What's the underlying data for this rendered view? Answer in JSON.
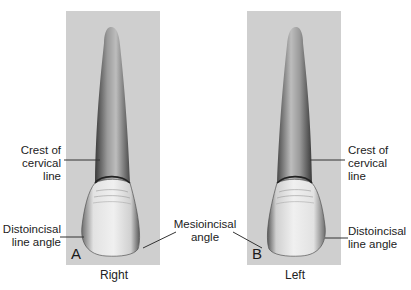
{
  "figure": {
    "panels": [
      {
        "letter": "A",
        "caption": "Right"
      },
      {
        "letter": "B",
        "caption": "Left"
      }
    ],
    "labels": {
      "crest_left": [
        "Crest of",
        "cervical",
        "line"
      ],
      "crest_right": [
        "Crest of",
        "cervical",
        "line"
      ],
      "distoincisal_left": [
        "Distoincisal",
        "line angle"
      ],
      "distoincisal_right": [
        "Distoincisal",
        "line angle"
      ],
      "mesioincisal": [
        "Mesioincisal",
        "angle"
      ]
    },
    "colors": {
      "panel_bg": "#cfcfcf",
      "leader_line": "#333333"
    }
  }
}
